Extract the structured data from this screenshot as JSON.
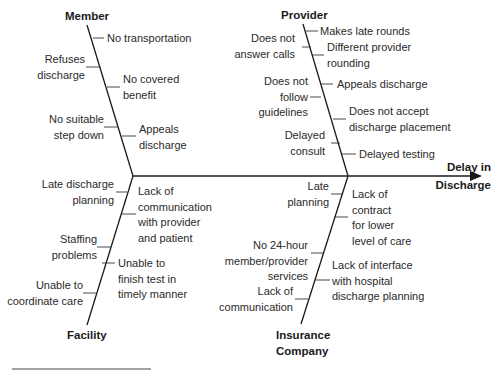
{
  "diagram": {
    "type": "fishbone",
    "effect": {
      "line1": "Delay in",
      "line2": "Discharge"
    },
    "categories": {
      "member": {
        "label": "Member",
        "causes": [
          "No transportation",
          "Refuses\ndischarge",
          "No covered\nbenefit",
          "No suitable\nstep down",
          "Appeals\ndischarge"
        ]
      },
      "provider": {
        "label": "Provider",
        "causes": [
          "Makes late rounds",
          "Does not\nanswer calls",
          "Different provider\nrounding",
          "Does  not\nfollow\nguidelines",
          "Appeals discharge",
          "Does not accept\ndischarge placement",
          "Delayed\nconsult",
          "Delayed testing"
        ]
      },
      "facility": {
        "label": "Facility",
        "causes": [
          "Late discharge\nplanning",
          "Lack of\ncommunication\nwith provider\nand patient",
          "Staffing\nproblems",
          "Unable to\nfinish test in\ntimely manner",
          "Unable to\ncoordinate care"
        ]
      },
      "insurance": {
        "label_line1": "Insurance",
        "label_line2": "Company",
        "causes": [
          "Late\nplanning",
          "Lack of\ncontract\nfor lower\nlevel of care",
          "No 24-hour\nmember/provider\nservices",
          "Lack of interface\nwith hospital\ndischarge planning",
          "Lack of\ncommunication"
        ]
      }
    }
  }
}
